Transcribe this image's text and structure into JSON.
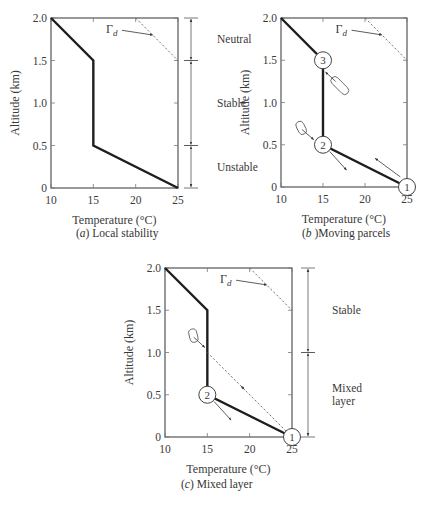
{
  "chart_data": [
    {
      "type": "line",
      "id": "a",
      "caption_letter": "a",
      "caption_text": "Local stability",
      "caption_prefix": "(",
      "caption_suffix": ") ",
      "xlabel": "Temperature (°C)",
      "ylabel": "Altitude (km)",
      "xlim": [
        10,
        25
      ],
      "ylim": [
        0,
        2.0
      ],
      "xticks": [
        10,
        15,
        20,
        25
      ],
      "xtick_labels": [
        "10",
        "15",
        "20",
        "25"
      ],
      "yticks": [
        0,
        0.5,
        1.0,
        1.5,
        2.0
      ],
      "ytick_labels": [
        "0",
        "0.5",
        "1.0",
        "1.5",
        "2.0"
      ],
      "grid": false,
      "series": [
        {
          "name": "Ambient temperature profile",
          "style": "solid-thick",
          "x": [
            25,
            15,
            15,
            10
          ],
          "y": [
            0,
            0.5,
            1.5,
            2.0
          ]
        },
        {
          "name": "Dry adiabatic lapse rate",
          "style": "dashed",
          "x": [
            20,
            25
          ],
          "y": [
            2.0,
            1.5
          ]
        }
      ],
      "annotations": [
        {
          "text": "Γ",
          "subscript": "d",
          "x": 16.5,
          "y": 1.82,
          "arrow_to": [
            22,
            1.8
          ]
        }
      ],
      "regions": [
        {
          "label": [
            "Neutral"
          ],
          "y_range": [
            1.5,
            2.0
          ]
        },
        {
          "label": [
            "Stable"
          ],
          "y_range": [
            0.5,
            1.5
          ]
        },
        {
          "label": [
            "Unstable"
          ],
          "y_range": [
            0,
            0.5
          ]
        }
      ],
      "parcels": [],
      "parcel_arrows": []
    },
    {
      "type": "line",
      "id": "b",
      "caption_letter": "b",
      "caption_text": "Moving parcels",
      "caption_prefix": "(",
      "caption_suffix": " )",
      "xlabel": "Temperature (°C)",
      "ylabel": "Altitude (km)",
      "xlim": [
        10,
        25
      ],
      "ylim": [
        0,
        2.0
      ],
      "xticks": [
        10,
        15,
        20,
        25
      ],
      "xtick_labels": [
        "10",
        "15",
        "20",
        "25"
      ],
      "yticks": [
        0,
        0.5,
        1.0,
        1.5,
        2.0
      ],
      "ytick_labels": [
        "0",
        "0.5",
        "1.0",
        "1.5",
        "2.0"
      ],
      "grid": false,
      "series": [
        {
          "name": "Ambient temperature profile",
          "style": "solid-thick",
          "x": [
            25,
            15,
            15,
            10
          ],
          "y": [
            0,
            0.5,
            1.5,
            2.0
          ]
        },
        {
          "name": "Dry adiabatic lapse rate",
          "style": "dashed",
          "x": [
            20,
            25
          ],
          "y": [
            2.0,
            1.5
          ]
        }
      ],
      "annotations": [
        {
          "text": "Γ",
          "subscript": "d",
          "x": 16.5,
          "y": 1.82,
          "arrow_to": [
            22,
            1.8
          ]
        }
      ],
      "regions": [],
      "parcels": [
        {
          "label": "1",
          "x": 25,
          "y": 0
        },
        {
          "label": "2",
          "x": 15,
          "y": 0.5
        },
        {
          "label": "3",
          "x": 15,
          "y": 1.5
        }
      ],
      "parcel_arrows": [
        {
          "from": [
            24.2,
            0.12
          ],
          "to": [
            21.2,
            0.34
          ]
        },
        {
          "from": [
            15.8,
            0.42
          ],
          "to": [
            17.8,
            0.2
          ]
        }
      ],
      "loops": [
        {
          "from": [
            16.5,
            1.25
          ],
          "to": [
            15.3,
            1.36
          ],
          "start": [
            17.5,
            1.15
          ]
        },
        {
          "from": [
            12.5,
            0.68
          ],
          "to": [
            13.9,
            0.56
          ],
          "start": [
            12.3,
            0.72
          ]
        }
      ]
    },
    {
      "type": "line",
      "id": "c",
      "caption_letter": "c",
      "caption_text": "Mixed layer",
      "caption_prefix": "(",
      "caption_suffix": ") ",
      "xlabel": "Temperature (°C)",
      "ylabel": "Altitude (km)",
      "xlim": [
        10,
        25
      ],
      "ylim": [
        0,
        2.0
      ],
      "xticks": [
        10,
        15,
        20,
        25
      ],
      "xtick_labels": [
        "10",
        "15",
        "20",
        "25"
      ],
      "yticks": [
        0,
        0.5,
        1.0,
        1.5,
        2.0
      ],
      "ytick_labels": [
        "0",
        "0.5",
        "1.0",
        "1.5",
        "2.0"
      ],
      "grid": false,
      "series": [
        {
          "name": "Ambient temperature profile",
          "style": "solid-thick",
          "x": [
            25,
            15,
            15,
            10
          ],
          "y": [
            0,
            0.5,
            1.5,
            2.0
          ]
        },
        {
          "name": "Dry adiabatic lapse rate",
          "style": "dashed",
          "x": [
            20,
            25
          ],
          "y": [
            2.0,
            1.5
          ]
        },
        {
          "name": "Parcel path (dry adiabat from surface)",
          "style": "dashed",
          "x": [
            25,
            15
          ],
          "y": [
            0,
            1.0
          ]
        }
      ],
      "annotations": [
        {
          "text": "Γ",
          "subscript": "d",
          "x": 16.5,
          "y": 1.82,
          "arrow_to": [
            22,
            1.8
          ]
        }
      ],
      "regions": [
        {
          "label": [
            "Stable"
          ],
          "y_range": [
            1.0,
            2.0
          ]
        },
        {
          "label": [
            "Mixed",
            "layer"
          ],
          "y_range": [
            0,
            1.0
          ]
        }
      ],
      "parcels": [
        {
          "label": "1",
          "x": 25,
          "y": 0
        },
        {
          "label": "2",
          "x": 15,
          "y": 0.5
        }
      ],
      "parcel_arrows": [
        {
          "from": [
            15.8,
            0.42
          ],
          "to": [
            17.8,
            0.2
          ]
        },
        {
          "from": [
            19.4,
            0.56
          ],
          "to": [
            19.0,
            0.6
          ]
        }
      ],
      "loops": [
        {
          "from": [
            13.4,
            1.18
          ],
          "to": [
            14.7,
            1.06
          ],
          "start": [
            13.3,
            1.22
          ]
        }
      ]
    }
  ],
  "layout": {
    "plots": [
      {
        "x0": 51,
        "y0": 18,
        "w": 127,
        "h": 170,
        "caption_x": 76,
        "caption_y": 239,
        "region_bar_x": 191,
        "region_label_x": 217
      },
      {
        "x0": 281,
        "y0": 18,
        "w": 126,
        "h": 169,
        "caption_x": 302,
        "caption_y": 239
      },
      {
        "x0": 165,
        "y0": 268,
        "w": 127,
        "h": 169,
        "caption_x": 181,
        "caption_y": 490,
        "region_bar_x": 308,
        "region_label_x": 332
      }
    ]
  }
}
